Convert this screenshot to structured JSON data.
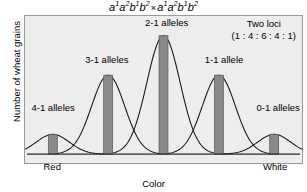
{
  "chart_data": {
    "type": "bar",
    "title_parts": {
      "p1": "a",
      "s1": "1",
      "p2": "a",
      "s2": "2",
      "p3": "b",
      "s3": "1",
      "p4": "b",
      "s4": "2",
      "operator": "×",
      "p5": "a",
      "s5": "1",
      "p6": "a",
      "s6": "2",
      "p7": "b",
      "s7": "1",
      "p8": "b",
      "s8": "2"
    },
    "xlabel": "Color",
    "ylabel": "Number of wheat grains",
    "xtick_labels": [
      "Red",
      "White"
    ],
    "categories": [
      "4-1 alleles",
      "3-1 alleles",
      "2-1 alleles",
      "1-1 allele",
      "0-1 alleles"
    ],
    "values": [
      1,
      4,
      6,
      4,
      1
    ],
    "ylim": [
      0,
      6.6
    ],
    "ratio_text": "(1 : 4 : 6 : 4 : 1)",
    "annotation_title": "Two loci",
    "grid": false,
    "legend": "none",
    "overlay": "gaussian-curves",
    "bar_color": "#8a8a8a",
    "bar_edge_color": "#555555",
    "curve_color": "#1a1a1a",
    "plot_background": "#ededed",
    "plot_border_color": "#9a9a9a",
    "axis_color": "#2b2b2b"
  },
  "labels": {
    "peak0": "4-1 alleles",
    "peak1": "3-1 alleles",
    "peak2": "2-1 alleles",
    "peak3": "1-1 allele",
    "peak4": "0-1 alleles",
    "two_loci": "Two loci",
    "ratio": "(1 : 4 : 6 : 4 : 1)",
    "x_left": "Red",
    "x_right": "White",
    "x_axis": "Color",
    "y_axis": "Number of wheat grains"
  }
}
